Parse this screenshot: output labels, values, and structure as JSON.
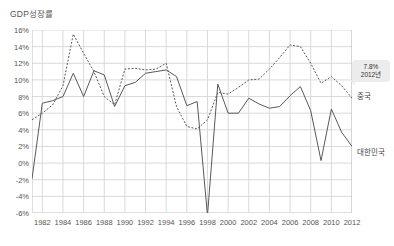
{
  "chart_title": "GDP성장률",
  "series_labels": {
    "china": "중국",
    "korea": "대한민국"
  },
  "tooltip": {
    "value": "7.8%",
    "year": "2012년"
  },
  "axis": {
    "y_ticks": [
      "16%",
      "14%",
      "12%",
      "10%",
      "8%",
      "6%",
      "4%",
      "2%",
      "0%",
      "-2%",
      "-4%",
      "-6%"
    ],
    "x_ticks": [
      "1982",
      "1984",
      "1986",
      "1988",
      "1990",
      "1992",
      "1994",
      "1996",
      "1998",
      "2000",
      "2002",
      "2004",
      "2006",
      "2008",
      "2010",
      "2012"
    ]
  },
  "colors": {
    "line": "#595959",
    "grid": "#d9d9d9",
    "axis": "#bfbfbf",
    "text": "#555555",
    "tooltip_bg": "#ececec"
  },
  "chart_data": {
    "type": "line",
    "title": "GDP성장률",
    "xlabel": "",
    "ylabel": "GDP성장률",
    "ylim": [
      -6,
      16
    ],
    "xlim": [
      1981,
      2012
    ],
    "grid": true,
    "legend_position": "right-inline",
    "x": [
      1981,
      1982,
      1983,
      1984,
      1985,
      1986,
      1987,
      1988,
      1989,
      1990,
      1991,
      1992,
      1993,
      1994,
      1995,
      1996,
      1997,
      1998,
      1999,
      2000,
      2001,
      2002,
      2003,
      2004,
      2005,
      2006,
      2007,
      2008,
      2009,
      2010,
      2011,
      2012
    ],
    "series": [
      {
        "name": "대한민국",
        "style": "solid",
        "values": [
          -1.9,
          7.2,
          7.5,
          8.0,
          10.8,
          8.0,
          11.1,
          10.6,
          6.8,
          9.3,
          9.7,
          10.8,
          11.0,
          11.2,
          10.4,
          6.9,
          7.4,
          -6.3,
          9.5,
          6.0,
          6.0,
          7.8,
          7.1,
          6.6,
          6.8,
          8.1,
          9.2,
          6.3,
          0.3,
          6.5,
          3.7,
          2.0
        ]
      },
      {
        "name": "중국",
        "style": "dotted",
        "values": [
          5.2,
          6.0,
          7.0,
          9.3,
          15.5,
          13.2,
          11.0,
          8.0,
          7.0,
          11.3,
          11.4,
          11.2,
          11.3,
          12.0,
          6.8,
          4.4,
          4.1,
          5.2,
          8.5,
          8.3,
          9.1,
          10.0,
          10.1,
          11.3,
          12.7,
          14.2,
          14.0,
          12.0,
          9.6,
          10.4,
          9.3,
          7.8
        ]
      }
    ],
    "annotation": {
      "label": "7.8%",
      "sublabel": "2012년",
      "series": "중국",
      "x": 2012,
      "y": 7.8
    }
  }
}
